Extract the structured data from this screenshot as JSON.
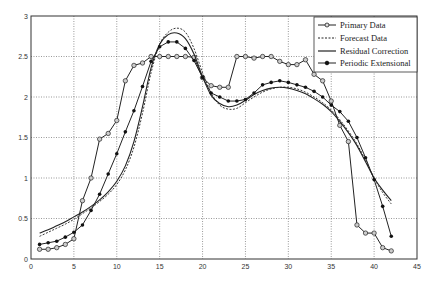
{
  "chart_data": {
    "type": "line",
    "title": "",
    "xlabel": "",
    "ylabel": "",
    "xlim": [
      0,
      45
    ],
    "ylim": [
      0,
      3
    ],
    "grid": true,
    "legend_position": "upper right",
    "x_ticks": [
      "0",
      "5",
      "10",
      "15",
      "20",
      "25",
      "30",
      "35",
      "40",
      "45"
    ],
    "y_ticks": [
      "0",
      "0.5",
      "1",
      "1.5",
      "2",
      "2.5",
      "3"
    ],
    "x": [
      1,
      2,
      3,
      4,
      5,
      6,
      7,
      8,
      9,
      10,
      11,
      12,
      13,
      14,
      15,
      16,
      17,
      18,
      19,
      20,
      21,
      22,
      23,
      24,
      25,
      26,
      27,
      28,
      29,
      30,
      31,
      32,
      33,
      34,
      35,
      36,
      37,
      38,
      39,
      40,
      41,
      42
    ],
    "series": [
      {
        "name": "Primary Data",
        "style": "solid-open-circle",
        "values": [
          0.12,
          0.12,
          0.14,
          0.18,
          0.25,
          0.72,
          1.0,
          1.48,
          1.55,
          1.71,
          2.2,
          2.39,
          2.42,
          2.5,
          2.5,
          2.5,
          2.5,
          2.5,
          2.49,
          2.24,
          2.14,
          2.12,
          2.12,
          2.5,
          2.5,
          2.48,
          2.5,
          2.5,
          2.44,
          2.4,
          2.4,
          2.46,
          2.28,
          2.2,
          1.95,
          1.65,
          1.45,
          0.42,
          0.32,
          0.32,
          0.14,
          0.1
        ]
      },
      {
        "name": "Forecast Data",
        "style": "dashed",
        "values": [
          0.28,
          0.33,
          0.38,
          0.43,
          0.49,
          0.56,
          0.63,
          0.71,
          0.8,
          0.92,
          1.1,
          1.38,
          1.8,
          2.3,
          2.65,
          2.8,
          2.85,
          2.8,
          2.6,
          2.3,
          2.05,
          1.9,
          1.85,
          1.86,
          1.93,
          2.0,
          2.06,
          2.1,
          2.12,
          2.12,
          2.1,
          2.06,
          2.0,
          1.93,
          1.84,
          1.72,
          1.58,
          1.42,
          1.22,
          1.0,
          0.82,
          0.68
        ]
      },
      {
        "name": "Residual Correction",
        "style": "solid",
        "values": [
          0.32,
          0.36,
          0.41,
          0.46,
          0.52,
          0.58,
          0.65,
          0.73,
          0.83,
          0.96,
          1.15,
          1.45,
          1.88,
          2.36,
          2.65,
          2.77,
          2.79,
          2.72,
          2.53,
          2.25,
          2.02,
          1.92,
          1.88,
          1.9,
          1.96,
          2.03,
          2.08,
          2.11,
          2.12,
          2.11,
          2.08,
          2.04,
          1.98,
          1.91,
          1.82,
          1.7,
          1.56,
          1.4,
          1.2,
          1.0,
          0.85,
          0.72
        ]
      },
      {
        "name": "Periodic Extensional",
        "style": "solid-filled-dot",
        "values": [
          0.18,
          0.2,
          0.22,
          0.27,
          0.33,
          0.42,
          0.6,
          0.8,
          1.05,
          1.3,
          1.57,
          1.83,
          2.13,
          2.44,
          2.62,
          2.68,
          2.68,
          2.6,
          2.45,
          2.24,
          2.05,
          2.0,
          1.95,
          1.95,
          1.97,
          2.05,
          2.15,
          2.18,
          2.2,
          2.18,
          2.15,
          2.12,
          2.07,
          2.0,
          1.9,
          1.82,
          1.7,
          1.5,
          1.25,
          0.98,
          0.65,
          0.28
        ]
      }
    ]
  },
  "legend": {
    "items": [
      "Primary Data",
      "Forecast Data",
      "Residual Correction",
      "Periodic Extensional"
    ]
  },
  "colors": {
    "line": "#222222",
    "grid": "#555555",
    "axis": "#333333"
  }
}
